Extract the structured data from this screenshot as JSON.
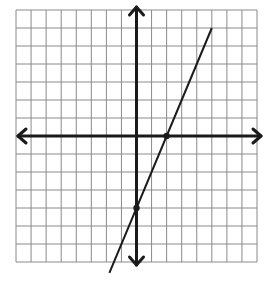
{
  "chart_data": {
    "type": "line",
    "title": "",
    "xlabel": "",
    "ylabel": "",
    "grid": true,
    "xlim": [
      -8,
      8
    ],
    "ylim": [
      -7,
      7
    ],
    "grid_columns": 16,
    "grid_rows": 14,
    "axes": {
      "x_arrows": true,
      "y_arrows": true
    },
    "series": [
      {
        "name": "y = 2x - 4",
        "slope": 2,
        "intercept": -4,
        "x": [
          -1.8,
          5
        ],
        "y": [
          -7.6,
          6
        ]
      }
    ],
    "points": [
      {
        "name": "x-intercept",
        "x": 2,
        "y": 0
      },
      {
        "name": "y-intercept",
        "x": 0,
        "y": -4
      }
    ],
    "colors": {
      "grid": "#8a8a8a",
      "axis": "#1a1a1a",
      "line": "#1a1a1a",
      "background": "#ffffff"
    }
  }
}
